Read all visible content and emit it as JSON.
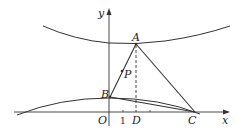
{
  "figure": {
    "type": "geometry-diagram",
    "axes": {
      "x_label": "x",
      "y_label": "y",
      "origin_label": "O",
      "tick_labels": [
        "1"
      ]
    },
    "points": [
      {
        "name": "A",
        "label": "A"
      },
      {
        "name": "B",
        "label": "B"
      },
      {
        "name": "C",
        "label": "C"
      },
      {
        "name": "D",
        "label": "D"
      },
      {
        "name": "P",
        "label": "P"
      }
    ],
    "curves": [
      "upper-curve",
      "lower-curve"
    ],
    "segments": [
      "AB",
      "AC",
      "BC",
      "AD (dashed)"
    ],
    "colors": {
      "stroke": "#333333",
      "background": "#ffffff"
    }
  }
}
